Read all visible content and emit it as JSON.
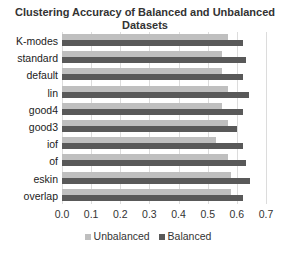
{
  "chart_data": {
    "type": "bar",
    "orientation": "horizontal",
    "title": "Clustering Accuracy of Balanced and Unbalanced Datasets",
    "categories": [
      "K-modes",
      "standard",
      "default",
      "lin",
      "good4",
      "good3",
      "iof",
      "of",
      "eskin",
      "overlap"
    ],
    "series": [
      {
        "name": "Unbalanced",
        "color": "#bfbfbf",
        "values": [
          0.57,
          0.55,
          0.55,
          0.57,
          0.55,
          0.57,
          0.53,
          0.57,
          0.58,
          0.58
        ]
      },
      {
        "name": "Balanced",
        "color": "#595959",
        "values": [
          0.62,
          0.63,
          0.62,
          0.64,
          0.62,
          0.6,
          0.62,
          0.63,
          0.645,
          0.62
        ]
      }
    ],
    "xlabel": "",
    "ylabel": "",
    "xlim": [
      0.0,
      0.7
    ],
    "xticks": [
      "0.0",
      "0.1",
      "0.2",
      "0.3",
      "0.4",
      "0.5",
      "0.6",
      "0.7"
    ],
    "grid": true,
    "legend_position": "bottom"
  },
  "title": "Clustering Accuracy of Balanced and Unbalanced Datasets",
  "legend": [
    {
      "label": "Unbalanced",
      "color": "#bfbfbf"
    },
    {
      "label": "Balanced",
      "color": "#595959"
    }
  ]
}
